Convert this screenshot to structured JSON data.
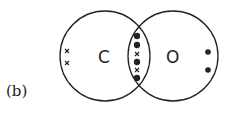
{
  "figure": {
    "part_label": "(b)",
    "atoms": [
      {
        "symbol": "C",
        "lone_electrons": [
          "x",
          "x"
        ]
      },
      {
        "symbol": "O",
        "lone_electrons": [
          "dot",
          "dot"
        ]
      }
    ],
    "shared_electrons": [
      "dot",
      "dot",
      "x",
      "dot",
      "x",
      "dot"
    ],
    "colors": {
      "line": "#222222",
      "background": "#ffffff"
    }
  }
}
